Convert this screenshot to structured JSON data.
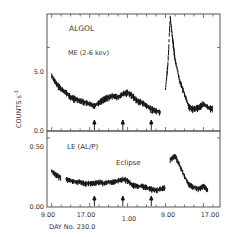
{
  "chart_data": [
    {
      "type": "line",
      "panel": "upper",
      "title": "ALGOL",
      "subtitle": "ME (2-6 kev)",
      "xlabel": "DAY No. 230.0",
      "ylabel": "COUNTS s^-1",
      "ylim": [
        0.0,
        7.0
      ],
      "yticks": [
        "0.0",
        "5.0"
      ],
      "grid": false,
      "x": [
        9,
        10,
        11,
        12,
        13,
        14,
        15,
        16,
        17,
        18,
        19,
        20,
        21,
        22,
        23,
        24,
        25,
        26,
        27,
        28,
        29,
        30,
        31,
        32,
        33,
        33.5,
        34,
        34.5,
        35,
        36,
        37,
        38,
        39,
        40,
        41,
        42,
        43
      ],
      "values": [
        3.3,
        2.8,
        2.5,
        2.3,
        2.0,
        1.9,
        1.8,
        1.7,
        1.6,
        1.5,
        1.7,
        1.9,
        2.0,
        2.1,
        2.0,
        2.2,
        2.3,
        2.1,
        1.8,
        1.7,
        1.5,
        1.3,
        1.2,
        1.1,
        2.5,
        4.0,
        6.8,
        5.5,
        4.3,
        3.0,
        2.2,
        1.4,
        1.3,
        1.4,
        1.6,
        1.4,
        1.3
      ],
      "arrow_markers_x": [
        18,
        24,
        30
      ]
    },
    {
      "type": "line",
      "panel": "lower",
      "title": "LE (AL/P)",
      "annotation": "Eclipse",
      "xlabel": "DAY No. 230.0",
      "ylim": [
        0.0,
        0.55
      ],
      "yticks": [
        "0.00",
        "0.50"
      ],
      "xtick_labels": [
        "9.00",
        "17.00",
        "1.00",
        "9.00",
        "17.00"
      ],
      "xtick_positions": [
        9,
        17,
        25,
        33,
        41
      ],
      "grid": false,
      "x": [
        9,
        10,
        11,
        12,
        13,
        14,
        15,
        16,
        17,
        18,
        19,
        20,
        21,
        22,
        23,
        24,
        25,
        26,
        27,
        28,
        29,
        30,
        31,
        32,
        33,
        34,
        35,
        36,
        37,
        38,
        39,
        40,
        41,
        42
      ],
      "values": [
        0.26,
        0.23,
        0.21,
        0.2,
        0.19,
        0.18,
        0.18,
        0.17,
        0.17,
        0.17,
        0.18,
        0.17,
        0.18,
        0.18,
        0.19,
        0.2,
        0.19,
        0.16,
        0.15,
        0.15,
        0.14,
        0.13,
        0.12,
        0.13,
        0.14,
        0.34,
        0.37,
        0.3,
        0.22,
        0.16,
        0.14,
        0.13,
        0.15,
        0.12
      ],
      "arrow_markers_x": [
        18,
        24,
        30
      ]
    }
  ],
  "labels": {
    "algol": "ALGOL",
    "me_band": "ME (2-6 kev)",
    "le_band": "LE (AL/P)",
    "eclipse": "Eclipse",
    "ylabel": "COUNTS s",
    "ylabel_exp": "-1",
    "xlabel": "DAY No. 230.0",
    "upper_ytick_top": "5.0",
    "upper_ytick_bottom": "0.0",
    "lower_ytick_top": "0.50",
    "lower_ytick_bottom": "0.00",
    "xtick_1": "9.00",
    "xtick_2": "17.00",
    "xtick_3": "1.00",
    "xtick_4": "9.00",
    "xtick_5": "17.00"
  }
}
